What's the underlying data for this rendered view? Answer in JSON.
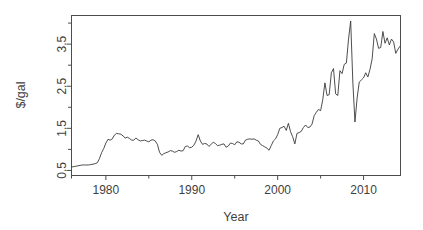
{
  "chart_data": {
    "type": "line",
    "title": "",
    "subtitle": "",
    "xlabel": "Year",
    "ylabel": "$/gal",
    "xlim": [
      1976.0,
      2014.3
    ],
    "ylim": [
      0.38,
      4.18
    ],
    "grid": false,
    "legend": "none",
    "x_ticks": [
      1980,
      1990,
      2000,
      2010
    ],
    "x_tick_labels": [
      "1980",
      "1990",
      "2000",
      "2010"
    ],
    "x_minor_ticks": [
      1976,
      1985,
      1995,
      2005
    ],
    "y_ticks": [
      0.5,
      1.5,
      2.5,
      3.5
    ],
    "y_tick_labels": [
      "0.5",
      "1.5",
      "2.5",
      "3.5"
    ],
    "y_minor_ticks": [
      1.0,
      2.0,
      3.0,
      4.0
    ],
    "series": [
      {
        "name": "US retail gasoline price",
        "color": "#3a3a3a",
        "x": [
          1976.0,
          1976.25,
          1976.5,
          1976.75,
          1977.0,
          1977.25,
          1977.5,
          1977.75,
          1978.0,
          1978.25,
          1978.5,
          1978.75,
          1979.0,
          1979.25,
          1979.5,
          1979.75,
          1980.0,
          1980.25,
          1980.5,
          1980.75,
          1981.0,
          1981.25,
          1981.5,
          1981.75,
          1982.0,
          1982.25,
          1982.5,
          1982.75,
          1983.0,
          1983.25,
          1983.5,
          1983.75,
          1984.0,
          1984.25,
          1984.5,
          1984.75,
          1985.0,
          1985.25,
          1985.5,
          1985.75,
          1986.0,
          1986.25,
          1986.5,
          1986.75,
          1987.0,
          1987.25,
          1987.5,
          1987.75,
          1988.0,
          1988.25,
          1988.5,
          1988.75,
          1989.0,
          1989.25,
          1989.5,
          1989.75,
          1990.0,
          1990.25,
          1990.5,
          1990.75,
          1991.0,
          1991.25,
          1991.5,
          1991.75,
          1992.0,
          1992.25,
          1992.5,
          1992.75,
          1993.0,
          1993.25,
          1993.5,
          1993.75,
          1994.0,
          1994.25,
          1994.5,
          1994.75,
          1995.0,
          1995.25,
          1995.5,
          1995.75,
          1996.0,
          1996.25,
          1996.5,
          1996.75,
          1997.0,
          1997.25,
          1997.5,
          1997.75,
          1998.0,
          1998.25,
          1998.5,
          1998.75,
          1999.0,
          1999.25,
          1999.5,
          1999.75,
          2000.0,
          2000.25,
          2000.5,
          2000.75,
          2001.0,
          2001.25,
          2001.5,
          2001.75,
          2002.0,
          2002.25,
          2002.5,
          2002.75,
          2003.0,
          2003.25,
          2003.5,
          2003.75,
          2004.0,
          2004.25,
          2004.5,
          2004.75,
          2005.0,
          2005.25,
          2005.5,
          2005.75,
          2006.0,
          2006.25,
          2006.5,
          2006.75,
          2007.0,
          2007.25,
          2007.5,
          2007.75,
          2008.0,
          2008.25,
          2008.5,
          2008.75,
          2009.0,
          2009.25,
          2009.5,
          2009.75,
          2010.0,
          2010.25,
          2010.5,
          2010.75,
          2011.0,
          2011.25,
          2011.5,
          2011.75,
          2012.0,
          2012.25,
          2012.5,
          2012.75,
          2013.0,
          2013.25,
          2013.5,
          2013.75,
          2014.0,
          2014.25
        ],
        "y": [
          0.58,
          0.59,
          0.6,
          0.61,
          0.62,
          0.63,
          0.63,
          0.63,
          0.63,
          0.64,
          0.65,
          0.66,
          0.68,
          0.78,
          0.92,
          1.02,
          1.15,
          1.24,
          1.22,
          1.25,
          1.34,
          1.38,
          1.37,
          1.36,
          1.32,
          1.27,
          1.29,
          1.26,
          1.22,
          1.22,
          1.27,
          1.23,
          1.2,
          1.21,
          1.22,
          1.2,
          1.18,
          1.22,
          1.23,
          1.2,
          1.12,
          0.93,
          0.86,
          0.9,
          0.92,
          0.94,
          0.97,
          0.96,
          0.93,
          0.95,
          0.98,
          0.96,
          0.97,
          1.07,
          1.08,
          1.04,
          1.05,
          1.1,
          1.2,
          1.35,
          1.2,
          1.12,
          1.14,
          1.13,
          1.07,
          1.12,
          1.17,
          1.14,
          1.09,
          1.1,
          1.12,
          1.13,
          1.05,
          1.08,
          1.15,
          1.14,
          1.11,
          1.18,
          1.17,
          1.13,
          1.13,
          1.22,
          1.24,
          1.25,
          1.24,
          1.25,
          1.22,
          1.2,
          1.12,
          1.09,
          1.06,
          1.03,
          0.98,
          1.09,
          1.2,
          1.25,
          1.35,
          1.5,
          1.52,
          1.55,
          1.45,
          1.62,
          1.42,
          1.3,
          1.13,
          1.38,
          1.4,
          1.43,
          1.52,
          1.58,
          1.52,
          1.53,
          1.6,
          1.8,
          1.88,
          1.95,
          1.92,
          2.18,
          2.58,
          2.28,
          2.3,
          2.82,
          2.92,
          2.32,
          2.28,
          2.87,
          2.8,
          3.02,
          3.05,
          3.62,
          4.05,
          2.6,
          1.65,
          2.22,
          2.6,
          2.65,
          2.7,
          2.82,
          2.72,
          2.9,
          3.15,
          3.75,
          3.62,
          3.4,
          3.42,
          3.8,
          3.52,
          3.65,
          3.48,
          3.62,
          3.55,
          3.28,
          3.38,
          3.45
        ]
      }
    ]
  },
  "figure": {
    "background_color": "#ffffff",
    "axis_color": "#4d4d4d",
    "line_color": "#3a3a3a",
    "text_color": "#3f3f3f"
  }
}
